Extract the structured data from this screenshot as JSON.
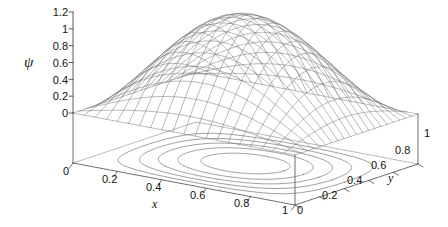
{
  "figure": {
    "background_color": "#ffffff",
    "line_color": "#6e6e6e",
    "axis_color": "#4a4a4a",
    "text_color": "#111111",
    "width": 448,
    "height": 227
  },
  "chart_data": {
    "type": "surface",
    "render_style": "meshc",
    "title": "",
    "xlabel": "x",
    "ylabel": "y",
    "zlabel": "ψ",
    "xlim": [
      0,
      1
    ],
    "ylim": [
      0,
      1
    ],
    "zlim": [
      0,
      1.2
    ],
    "grid": false,
    "legend": null,
    "x_ticks": [
      0,
      0.2,
      0.4,
      0.6,
      0.8,
      1
    ],
    "x_tick_labels": [
      "0",
      "0.2",
      "0.4",
      "0.6",
      "0.8",
      "1"
    ],
    "y_ticks": [
      0,
      0.2,
      0.4,
      0.6,
      0.8,
      1
    ],
    "y_tick_labels": [
      "0",
      "0.2",
      "0.4",
      "0.6",
      "0.8",
      "1"
    ],
    "z_ticks": [
      0,
      0.2,
      0.4,
      0.6,
      0.8,
      1,
      1.2
    ],
    "z_tick_labels": [
      "0",
      "0.2",
      "0.4",
      "0.6",
      "0.8",
      "1",
      "1.2"
    ],
    "mesh_nx": 20,
    "mesh_ny": 20,
    "surface_peak_value": 1.17,
    "surface_peak_at": [
      0.5,
      0.5
    ],
    "boundary_value": 0,
    "contour_levels": [
      0.2,
      0.4,
      0.6,
      0.8,
      1.0
    ],
    "contour_count": 5,
    "view_azimuth": -37.5,
    "view_elevation": 30,
    "z_values_grid_note": "psi(x,y) = 1.17 * sin(pi*x) * sin(pi*y)"
  },
  "axes": {
    "z": {
      "label": "ψ",
      "ticks": [
        {
          "text": "1.2",
          "v": 1.2
        },
        {
          "text": "1",
          "v": 1.0
        },
        {
          "text": "0.8",
          "v": 0.8
        },
        {
          "text": "0.6",
          "v": 0.6
        },
        {
          "text": "0.4",
          "v": 0.4
        },
        {
          "text": "0.2",
          "v": 0.2
        },
        {
          "text": "0",
          "v": 0.0
        }
      ]
    },
    "x": {
      "label": "x",
      "ticks": [
        {
          "text": "0",
          "v": 0.0
        },
        {
          "text": "0.2",
          "v": 0.2
        },
        {
          "text": "0.4",
          "v": 0.4
        },
        {
          "text": "0.6",
          "v": 0.6
        },
        {
          "text": "0.8",
          "v": 0.8
        },
        {
          "text": "1",
          "v": 1.0
        }
      ]
    },
    "y": {
      "label": "y",
      "ticks": [
        {
          "text": "0",
          "v": 0.0
        },
        {
          "text": "0.2",
          "v": 0.2
        },
        {
          "text": "0.4",
          "v": 0.4
        },
        {
          "text": "0.6",
          "v": 0.6
        },
        {
          "text": "0.8",
          "v": 0.8
        },
        {
          "text": "1",
          "v": 1.0
        }
      ]
    }
  }
}
